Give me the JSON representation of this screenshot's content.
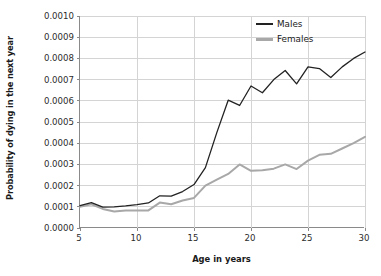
{
  "chart_data": {
    "type": "line",
    "title": "",
    "xlabel": "Age in years",
    "ylabel": "Probability of dying in the next year",
    "xlim": [
      5,
      30
    ],
    "ylim": [
      0.0,
      0.001
    ],
    "grid": true,
    "legend_position": "top-right",
    "x": [
      5,
      6,
      7,
      8,
      9,
      10,
      11,
      12,
      13,
      14,
      15,
      16,
      17,
      18,
      19,
      20,
      21,
      22,
      23,
      24,
      25,
      26,
      27,
      28,
      29,
      30
    ],
    "x_ticks": [
      "5",
      "10",
      "15",
      "20",
      "25",
      "30"
    ],
    "x_tick_values": [
      5,
      10,
      15,
      20,
      25,
      30
    ],
    "y_ticks": [
      "0.0000",
      "0.0001",
      "0.0002",
      "0.0003",
      "0.0004",
      "0.0005",
      "0.0006",
      "0.0007",
      "0.0008",
      "0.0009",
      "0.0010"
    ],
    "y_tick_values": [
      0.0,
      0.0001,
      0.0002,
      0.0003,
      0.0004,
      0.0005,
      0.0006,
      0.0007,
      0.0008,
      0.0009,
      0.001
    ],
    "series": [
      {
        "name": "Males",
        "color": "#222222",
        "values": [
          0.000105,
          0.00012,
          9.8e-05,
          0.0001,
          0.000104,
          0.00011,
          0.000118,
          0.000152,
          0.00015,
          0.000172,
          0.000205,
          0.000285,
          0.00045,
          0.000603,
          0.000578,
          0.00067,
          0.000638,
          0.0007,
          0.000743,
          0.00068,
          0.00076,
          0.000752,
          0.00071,
          0.00076,
          0.0008,
          0.00083
        ]
      },
      {
        "name": "Females",
        "color": "#a8a8a8",
        "values": [
          0.0001,
          0.000112,
          9e-05,
          7.8e-05,
          8.2e-05,
          8.2e-05,
          8.3e-05,
          0.00012,
          0.000112,
          0.00013,
          0.000142,
          0.0002,
          0.000228,
          0.000255,
          0.0003,
          0.00027,
          0.000272,
          0.00028,
          0.0003,
          0.000278,
          0.000318,
          0.000345,
          0.00035,
          0.000375,
          0.0004,
          0.00043
        ]
      }
    ]
  },
  "axis": {
    "x_title": "Age in years",
    "y_title": "Probability of dying in the next year"
  },
  "legend": {
    "items": [
      {
        "label": "Males",
        "color": "#222222"
      },
      {
        "label": "Females",
        "color": "#a8a8a8"
      }
    ]
  },
  "colors": {
    "males": "#222222",
    "females": "#a8a8a8",
    "grid": "#d4d4d4",
    "axis": "#8a8a8a",
    "background": "#ffffff"
  }
}
